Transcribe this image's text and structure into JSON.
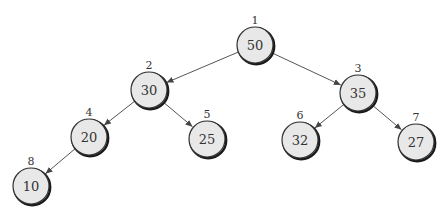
{
  "diagram": {
    "type": "binary-tree",
    "colors": {
      "node_fill": "#e8e8e8",
      "node_stroke": "#333333",
      "edge": "#555555",
      "text": "#333333"
    },
    "nodes": [
      {
        "index": "1",
        "value": "50",
        "cx": 255,
        "cy": 45
      },
      {
        "index": "2",
        "value": "30",
        "cx": 149,
        "cy": 90
      },
      {
        "index": "3",
        "value": "35",
        "cx": 358,
        "cy": 93
      },
      {
        "index": "4",
        "value": "20",
        "cx": 89,
        "cy": 137
      },
      {
        "index": "5",
        "value": "25",
        "cx": 207,
        "cy": 139
      },
      {
        "index": "6",
        "value": "32",
        "cx": 300,
        "cy": 140
      },
      {
        "index": "7",
        "value": "27",
        "cx": 416,
        "cy": 142
      },
      {
        "index": "8",
        "value": "10",
        "cx": 31,
        "cy": 186
      }
    ],
    "edges": [
      {
        "from": "1",
        "to": "2"
      },
      {
        "from": "1",
        "to": "3"
      },
      {
        "from": "2",
        "to": "4"
      },
      {
        "from": "2",
        "to": "5"
      },
      {
        "from": "3",
        "to": "6"
      },
      {
        "from": "3",
        "to": "7"
      },
      {
        "from": "4",
        "to": "8"
      }
    ]
  }
}
